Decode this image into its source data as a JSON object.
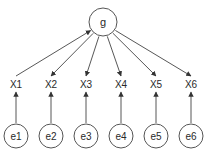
{
  "diagram": {
    "type": "factor-model",
    "colors": {
      "stroke": "#555555",
      "text": "#2a2a2a",
      "background": "#ffffff"
    },
    "latent": {
      "id": "g",
      "label": "g",
      "cx": 103,
      "cy": 22,
      "r": 14
    },
    "observed": [
      {
        "id": "X1",
        "label": "X1",
        "x": 16,
        "y": 88
      },
      {
        "id": "X2",
        "label": "X2",
        "x": 51,
        "y": 88
      },
      {
        "id": "X3",
        "label": "X3",
        "x": 86,
        "y": 88
      },
      {
        "id": "X4",
        "label": "X4",
        "x": 121,
        "y": 88
      },
      {
        "id": "X5",
        "label": "X5",
        "x": 156,
        "y": 88
      },
      {
        "id": "X6",
        "label": "X6",
        "x": 191,
        "y": 88
      }
    ],
    "errors": [
      {
        "id": "e1",
        "label": "e1",
        "cx": 16,
        "cy": 136,
        "r": 12
      },
      {
        "id": "e2",
        "label": "e2",
        "cx": 51,
        "cy": 136,
        "r": 12
      },
      {
        "id": "e3",
        "label": "e3",
        "cx": 86,
        "cy": 136,
        "r": 12
      },
      {
        "id": "e4",
        "label": "e4",
        "cx": 121,
        "cy": 136,
        "r": 12
      },
      {
        "id": "e5",
        "label": "e5",
        "cx": 156,
        "cy": 136,
        "r": 12
      },
      {
        "id": "e6",
        "label": "e6",
        "cx": 191,
        "cy": 136,
        "r": 12
      }
    ],
    "edges": [
      {
        "from": "X1",
        "to": "g"
      },
      {
        "from": "g",
        "to": "X2"
      },
      {
        "from": "g",
        "to": "X3"
      },
      {
        "from": "g",
        "to": "X4"
      },
      {
        "from": "g",
        "to": "X5"
      },
      {
        "from": "g",
        "to": "X6"
      },
      {
        "from": "e1",
        "to": "X1"
      },
      {
        "from": "e2",
        "to": "X2"
      },
      {
        "from": "e3",
        "to": "X3"
      },
      {
        "from": "e4",
        "to": "X4"
      },
      {
        "from": "e5",
        "to": "X5"
      },
      {
        "from": "e6",
        "to": "X6"
      }
    ]
  }
}
